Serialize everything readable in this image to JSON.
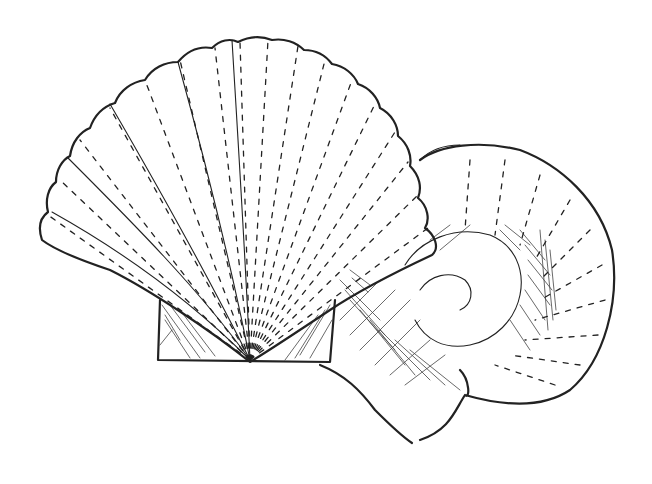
{
  "image": {
    "kind": "pen-and-ink illustration",
    "background": "#ffffff",
    "ink_color": "#222222",
    "subjects": [
      {
        "name": "scallop-shell",
        "description": "fan-shaped ribbed scallop shell with hinge ears at base"
      },
      {
        "name": "coiled-shell",
        "description": "coiled spiral shell behind scallop with cross-hatched shading"
      }
    ]
  }
}
